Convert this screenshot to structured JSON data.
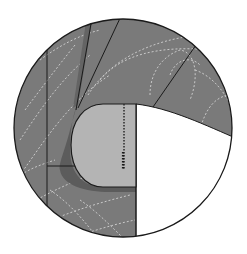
{
  "diagram": {
    "type": "sewing-detail-callout",
    "colors": {
      "background": "#ffffff",
      "fabric_main": "#7a7a7a",
      "fabric_shadow": "#5e5e5e",
      "pocket_fill": "#b4b4b4",
      "outline": "#1a1a1a",
      "quilting_stitch": "#c8c8c8",
      "topstitch": "#2a2a2a",
      "cutaway": "#ffffff"
    },
    "elements": {
      "circle_frame": "detail-circle",
      "fabric": "quilted-fabric",
      "pocket": "pocket-piece",
      "topstitch_line": "topstitch-line",
      "seam_lines": [
        "seam-line-1",
        "seam-line-2",
        "seam-line-3",
        "seam-line-4"
      ],
      "cutaway_area": "white-cutaway"
    }
  }
}
